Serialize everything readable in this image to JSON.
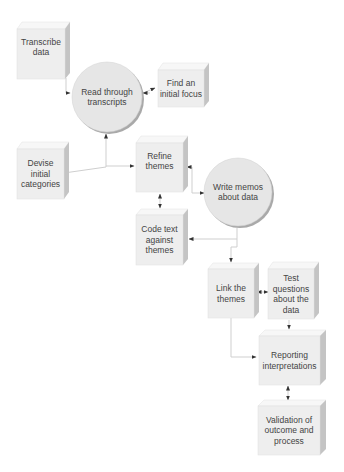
{
  "diagram": {
    "type": "flowchart",
    "colors": {
      "box_front": "#eeeeee",
      "box_top": "#f7f7f7",
      "box_side": "#c4c4c4",
      "circle_fill": "#e6e6e6",
      "circle_shadow": "#a9a9a9",
      "connector": "#cfcfcf",
      "arrow": "#333333",
      "text": "#444444"
    },
    "nodes": {
      "transcribe": {
        "label": "Transcribe\ndata",
        "shape": "box"
      },
      "read": {
        "label": "Read through\ntranscripts",
        "shape": "circle"
      },
      "find_focus": {
        "label": "Find an\ninitial focus",
        "shape": "box"
      },
      "devise": {
        "label": "Devise initial\ncategories",
        "shape": "box"
      },
      "refine": {
        "label": "Refine\nthemes",
        "shape": "box"
      },
      "memos": {
        "label": "Write memos\nabout data",
        "shape": "circle"
      },
      "code_text": {
        "label": "Code text\nagainst\nthemes",
        "shape": "box"
      },
      "link": {
        "label": "Link the\nthemes",
        "shape": "box"
      },
      "test": {
        "label": "Test\nquestions\nabout the\ndata",
        "shape": "box"
      },
      "reporting": {
        "label": "Reporting\ninterpretations",
        "shape": "box"
      },
      "validation": {
        "label": "Validation of\noutcome and\nprocess",
        "shape": "box"
      }
    },
    "edges": [
      {
        "from": "transcribe",
        "to": "read"
      },
      {
        "from": "read",
        "to": "find_focus"
      },
      {
        "from": "refine",
        "to": "read"
      },
      {
        "from": "refine",
        "to": "devise"
      },
      {
        "from": "devise",
        "to": "refine"
      },
      {
        "from": "memos",
        "to": "refine"
      },
      {
        "from": "refine",
        "to": "memos"
      },
      {
        "from": "refine",
        "to": "code_text",
        "bidirectional": true
      },
      {
        "from": "memos",
        "to": "code_text"
      },
      {
        "from": "memos",
        "to": "link"
      },
      {
        "from": "link",
        "to": "test",
        "bidirectional": true
      },
      {
        "from": "link",
        "to": "reporting"
      },
      {
        "from": "test",
        "to": "reporting"
      },
      {
        "from": "reporting",
        "to": "validation",
        "bidirectional": true
      }
    ]
  }
}
